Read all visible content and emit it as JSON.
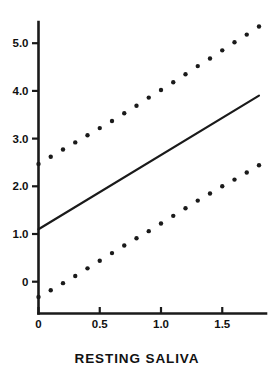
{
  "chart_data": {
    "type": "line",
    "title": "",
    "subtitle": "",
    "xlabel": "RESTING SALIVA",
    "ylabel": "",
    "xlim": [
      -0.03,
      1.87
    ],
    "ylim": [
      -0.62,
      5.62
    ],
    "grid": false,
    "legend": null,
    "x_ticks": [
      0,
      0.5,
      1.0,
      1.5
    ],
    "x_tick_labels": [
      "0",
      "0.5",
      "1.0",
      "1.5"
    ],
    "y_ticks": [
      0,
      1.0,
      2.0,
      3.0,
      4.0,
      5.0
    ],
    "y_tick_labels": [
      "0",
      "1.0",
      "2.0",
      "3.0",
      "4.0",
      "5.0"
    ],
    "series": [
      {
        "name": "regression-line",
        "style": "solid",
        "x": [
          0.0,
          1.8
        ],
        "values": [
          1.1,
          3.9
        ],
        "slope": 1.556,
        "intercept": 1.1
      },
      {
        "name": "upper-confidence-band",
        "style": "dotted",
        "x": [
          0.0,
          0.1,
          0.2,
          0.3,
          0.4,
          0.5,
          0.6,
          0.7,
          0.8,
          0.9,
          1.0,
          1.1,
          1.2,
          1.3,
          1.4,
          1.5,
          1.6,
          1.7,
          1.8
        ],
        "values": [
          2.47,
          2.62,
          2.77,
          2.92,
          3.07,
          3.22,
          3.37,
          3.53,
          3.69,
          3.86,
          4.02,
          4.18,
          4.35,
          4.52,
          4.68,
          4.85,
          5.02,
          5.18,
          5.35
        ]
      },
      {
        "name": "lower-confidence-band",
        "style": "dotted",
        "x": [
          0.0,
          0.1,
          0.2,
          0.3,
          0.4,
          0.5,
          0.6,
          0.7,
          0.8,
          0.9,
          1.0,
          1.1,
          1.2,
          1.3,
          1.4,
          1.5,
          1.6,
          1.7,
          1.8
        ],
        "values": [
          -0.32,
          -0.18,
          -0.03,
          0.12,
          0.28,
          0.44,
          0.6,
          0.76,
          0.91,
          1.06,
          1.22,
          1.38,
          1.54,
          1.7,
          1.85,
          2.0,
          2.14,
          2.29,
          2.44
        ]
      }
    ],
    "colors": {
      "line": "#1a1a1a",
      "dots": "#1a1a1a",
      "axis": "#1a1a1a",
      "background": "#ffffff"
    }
  }
}
